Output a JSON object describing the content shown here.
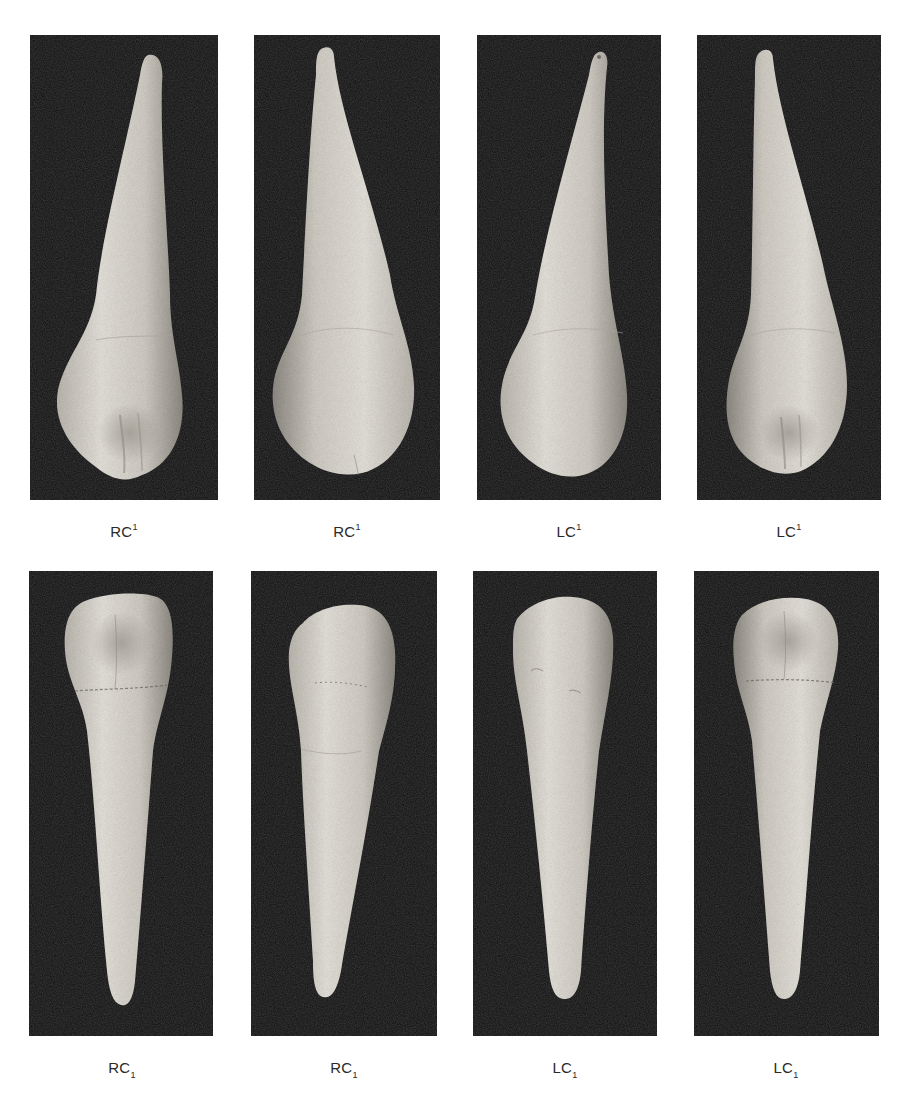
{
  "figure": {
    "layout": {
      "rows": 2,
      "columns": 4,
      "background": "#ffffff",
      "panel_background": "#0e0e0e",
      "tooth_color": "#d9d6cf"
    },
    "rows": [
      {
        "name": "maxillary-canines",
        "panels": [
          {
            "label_base": "RC",
            "label_index": "1",
            "index_position": "superscript",
            "view": "lingual",
            "tooth": "right maxillary canine"
          },
          {
            "label_base": "RC",
            "label_index": "1",
            "index_position": "superscript",
            "view": "labial",
            "tooth": "right maxillary canine"
          },
          {
            "label_base": "LC",
            "label_index": "1",
            "index_position": "superscript",
            "view": "labial",
            "tooth": "left maxillary canine"
          },
          {
            "label_base": "LC",
            "label_index": "1",
            "index_position": "superscript",
            "view": "lingual",
            "tooth": "left maxillary canine"
          }
        ]
      },
      {
        "name": "mandibular-canines",
        "panels": [
          {
            "label_base": "RC",
            "label_index": "1",
            "index_position": "subscript",
            "view": "lingual",
            "tooth": "right mandibular canine"
          },
          {
            "label_base": "RC",
            "label_index": "1",
            "index_position": "subscript",
            "view": "labial",
            "tooth": "right mandibular canine"
          },
          {
            "label_base": "LC",
            "label_index": "1",
            "index_position": "subscript",
            "view": "labial",
            "tooth": "left mandibular canine"
          },
          {
            "label_base": "LC",
            "label_index": "1",
            "index_position": "subscript",
            "view": "lingual",
            "tooth": "left mandibular canine"
          }
        ]
      }
    ]
  }
}
